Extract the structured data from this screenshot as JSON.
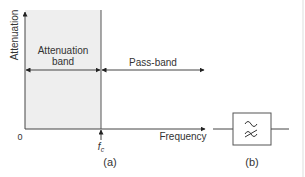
{
  "figure_a": {
    "y_axis_label": "Attenuation",
    "x_axis_label": "Frequency",
    "origin_label": "0",
    "cutoff_label": "f",
    "cutoff_subscript": "c",
    "attenuation_band_line1": "Attenuation",
    "attenuation_band_line2": "band",
    "pass_band_label": "Pass-band",
    "caption": "(a)"
  },
  "figure_b": {
    "symbol_top": "∼",
    "symbol_bottom": "≈",
    "caption": "(b)"
  },
  "colors": {
    "axis": "#444444",
    "shade": "#eeeeee",
    "text": "#333333",
    "right_border": "#dddddd"
  }
}
